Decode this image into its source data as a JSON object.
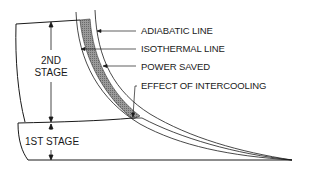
{
  "diagram": {
    "title": "",
    "labels": {
      "adiabatic": "ADIABATIC LINE",
      "isothermal": "ISOTHERMAL LINE",
      "power_saved": "POWER SAVED",
      "intercooling": "EFFECT OF INTERCOOLING"
    },
    "stages": {
      "second_line1": "2ND",
      "second_line2": "STAGE",
      "first": "1ST STAGE"
    },
    "colors": {
      "line": "#1a1a1a",
      "shade": "#8a8a8a",
      "background": "#ffffff"
    }
  }
}
